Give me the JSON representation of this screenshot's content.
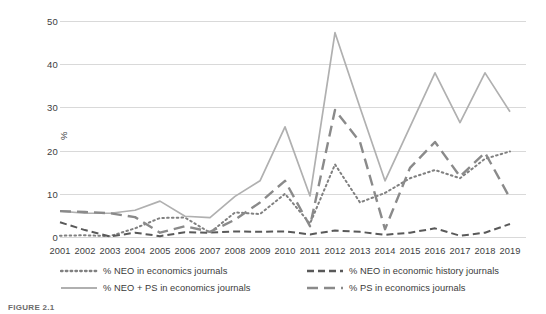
{
  "chart_data": {
    "type": "line",
    "title": "",
    "xlabel": "",
    "ylabel": "%",
    "ylim": [
      0,
      50
    ],
    "yticks": [
      0,
      10,
      20,
      30,
      40,
      50
    ],
    "grid": true,
    "legend_position": "bottom",
    "x": [
      2001,
      2002,
      2003,
      2004,
      2005,
      2006,
      2007,
      2008,
      2009,
      2010,
      2011,
      2012,
      2013,
      2014,
      2015,
      2016,
      2017,
      2018,
      2019
    ],
    "categories": [
      "2001",
      "2002",
      "2003",
      "2004",
      "2005",
      "2006",
      "2007",
      "2008",
      "2009",
      "2010",
      "2011",
      "2012",
      "2013",
      "2014",
      "2015",
      "2016",
      "2017",
      "2018",
      "2019"
    ],
    "series": [
      {
        "name": "% NEO in economics journals",
        "style": "dotted",
        "color": "#808080",
        "values": [
          0.3,
          0.4,
          0.2,
          2.0,
          4.4,
          4.5,
          1.0,
          5.7,
          5.3,
          10.0,
          3.1,
          16.8,
          8.0,
          10.2,
          13.6,
          15.5,
          13.6,
          18.1,
          19.8
        ]
      },
      {
        "name": "% NEO in economic history journals",
        "style": "dashed",
        "color": "#595959",
        "values": [
          3.4,
          1.6,
          0.1,
          1.0,
          0.2,
          1.1,
          1.0,
          1.3,
          1.2,
          1.3,
          0.6,
          1.5,
          1.2,
          0.5,
          1.0,
          2.0,
          0.3,
          1.0,
          3.0
        ]
      },
      {
        "name": "% NEO + PS in economics journals",
        "style": "solid",
        "color": "#b0b0b0",
        "values": [
          6.0,
          5.5,
          5.5,
          6.2,
          8.3,
          4.8,
          4.5,
          9.4,
          13.0,
          25.5,
          9.5,
          47.3,
          30.0,
          13.0,
          25.5,
          38.0,
          26.5,
          38.0,
          29.0
        ]
      },
      {
        "name": "% PS in economics journals",
        "style": "longdash",
        "color": "#8a8a8a",
        "values": [
          6.0,
          5.8,
          5.5,
          4.6,
          1.0,
          2.5,
          1.2,
          4.0,
          8.0,
          13.0,
          2.5,
          29.4,
          22.0,
          1.8,
          16.0,
          22.0,
          14.0,
          19.5,
          9.0
        ]
      }
    ]
  },
  "caption": {
    "text": "FIGURE 2.1"
  }
}
